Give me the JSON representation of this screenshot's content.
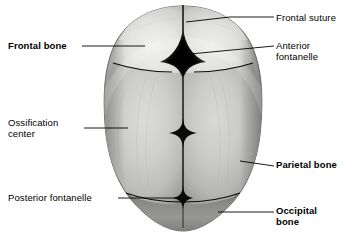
{
  "figure": {
    "background_color": "#ffffff",
    "line_color": "#000000"
  },
  "labels": [
    {
      "id": "frontal-suture",
      "text": "Frontal suture",
      "bold": false,
      "side": "right"
    },
    {
      "id": "anterior-fontanelle",
      "text": "Anterior\nfontanelle",
      "bold": false,
      "side": "right"
    },
    {
      "id": "frontal-bone",
      "text": "Frontal bone",
      "bold": true,
      "side": "left"
    },
    {
      "id": "ossification-center",
      "text": "Ossification\ncenter",
      "bold": false,
      "side": "left"
    },
    {
      "id": "posterior-fontanelle",
      "text": "Posterior fontanelle",
      "bold": false,
      "side": "left"
    },
    {
      "id": "parietal-bone",
      "text": "Parietal bone",
      "bold": true,
      "side": "right"
    },
    {
      "id": "occipital-bone",
      "text": "Occipital\nbone",
      "bold": true,
      "side": "right"
    }
  ],
  "anatomy": {
    "frontal_bone_left": "frontal bone left half",
    "frontal_bone_right": "frontal bone right half",
    "parietal_bone_left": "parietal bone left half",
    "parietal_bone_right": "parietal bone right half",
    "occipital_bone": "occipital bone",
    "frontal_suture": "frontal suture",
    "sagittal_suture": "sagittal suture",
    "coronal_suture": "coronal suture",
    "lambdoid_suture": "lambdoid suture",
    "anterior_fontanelle": "anterior fontanelle",
    "posterior_fontanelle": "posterior fontanelle",
    "ossification_center": "ossification center"
  },
  "colors": {
    "bone_light": "#e3e3e1",
    "bone_mid": "#b9b9b7",
    "bone_dark": "#8f8f8d",
    "occipital": "#8a8a88",
    "fontanelle_dark": "#1b1b1b",
    "outline": "#000000",
    "leader": "#000000"
  }
}
